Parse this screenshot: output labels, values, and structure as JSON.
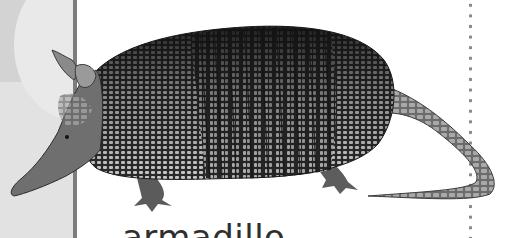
{
  "card": {
    "caption": "armadillo",
    "subject": "armadillo photograph",
    "colors": {
      "left_panel": "#e2e2e2",
      "left_square": "#d3d3d3",
      "divider_bar": "#7d7d7d",
      "dots": "#8a8a8a",
      "shell_dark": "#1e1e1e",
      "shell_light": "#bdbdbd"
    }
  }
}
